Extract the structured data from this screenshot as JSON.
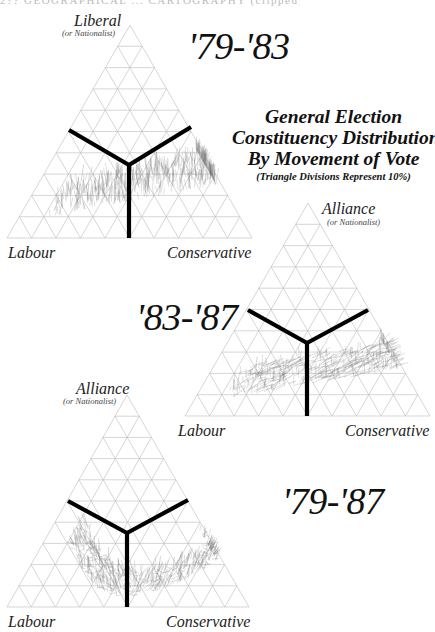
{
  "page": {
    "running_head": "2?? GEOGRAPHICAL ... CARTOGRAPHY (clipped)"
  },
  "title": {
    "lines": [
      "General Election",
      "Constituency Distribution",
      "By Movement of Vote"
    ],
    "subtitle": "(Triangle Divisions Represent 10%)"
  },
  "colors": {
    "grid": "#c4c4c4",
    "axis_y": "#000000",
    "scatter": "#8a8a8a",
    "scatter_dark": "#555555",
    "text": "#111111"
  },
  "chart_data": [
    {
      "type": "scatter",
      "subtype": "ternary-movement",
      "title": "'79-'83",
      "vertices": {
        "top": {
          "label": "Liberal",
          "sublabel": "(or Nationalist)"
        },
        "left": {
          "label": "Labour"
        },
        "right": {
          "label": "Conservative"
        }
      },
      "grid_divisions": 10,
      "grid_step_percent": 10,
      "divider": "Y-shaped boundaries meeting at centroid (33.3% each)",
      "scatter_description": "Constituency vote movement lines; band from lower-left (Labour side) sweeping up toward upper-right (Conservative/Liberal), roughly 10-40% Liberal share",
      "scatter_region": {
        "liberal_pct_range": [
          8,
          42
        ],
        "cons_pct_range": [
          15,
          75
        ],
        "orientation": "near-vertical strokes, upward to Liberal"
      }
    },
    {
      "type": "scatter",
      "subtype": "ternary-movement",
      "title": "'83-'87",
      "vertices": {
        "top": {
          "label": "Alliance",
          "sublabel": "(or Nationalist)"
        },
        "left": {
          "label": "Labour"
        },
        "right": {
          "label": "Conservative"
        }
      },
      "grid_divisions": 10,
      "grid_step_percent": 10,
      "divider": "Y-shaped boundaries meeting at centroid (33.3% each)",
      "scatter_description": "Movement lines mostly diagonal (Labour-ward shifts), concentrated 10-35% Alliance share",
      "scatter_region": {
        "liberal_pct_range": [
          8,
          38
        ],
        "cons_pct_range": [
          15,
          72
        ],
        "orientation": "diagonal strokes"
      }
    },
    {
      "type": "scatter",
      "subtype": "ternary-movement",
      "title": "'79-'87",
      "vertices": {
        "top": {
          "label": "Alliance",
          "sublabel": "(or Nationalist)"
        },
        "left": {
          "label": "Labour"
        },
        "right": {
          "label": "Conservative"
        }
      },
      "grid_divisions": 10,
      "grid_step_percent": 10,
      "divider": "Y-shaped boundaries meeting at centroid (33.3% each)",
      "scatter_description": "Movement lines forming a U / smile-shaped band, low at centre (~5-15% Alliance), rising at both Labour and Conservative ends to ~40%",
      "scatter_region": {
        "liberal_pct_range": [
          4,
          42
        ],
        "cons_pct_range": [
          10,
          78
        ],
        "orientation": "curved U-shaped band"
      }
    }
  ],
  "layout": {
    "triangles": [
      {
        "apex": [
          130,
          25
        ],
        "left": [
          7,
          238
        ],
        "right": [
          252,
          238
        ],
        "center": [
          129,
          165
        ],
        "arm_left": [
          69,
          130
        ],
        "arm_right": [
          191,
          127
        ],
        "seed": 11,
        "mode": "vertical",
        "count": 520,
        "period_pos": [
          188,
          27
        ],
        "top_label_pos": [
          74,
          13
        ],
        "top_sub_pos": [
          62,
          29
        ],
        "left_label_pos": [
          8,
          245
        ],
        "right_label_pos": [
          167,
          245
        ]
      },
      {
        "apex": [
          308,
          203
        ],
        "left": [
          185,
          416
        ],
        "right": [
          430,
          416
        ],
        "center": [
          307,
          343
        ],
        "arm_left": [
          248,
          310
        ],
        "arm_right": [
          368,
          310
        ],
        "seed": 37,
        "mode": "diagonal",
        "count": 420,
        "period_pos": [
          136,
          298
        ],
        "top_label_pos": [
          322,
          201
        ],
        "top_sub_pos": [
          327,
          218
        ],
        "left_label_pos": [
          178,
          423
        ],
        "right_label_pos": [
          345,
          423
        ]
      },
      {
        "apex": [
          127,
          395
        ],
        "left": [
          7,
          607
        ],
        "right": [
          249,
          607
        ],
        "center": [
          127,
          533
        ],
        "arm_left": [
          68,
          501
        ],
        "arm_right": [
          188,
          500
        ],
        "seed": 73,
        "mode": "smile",
        "count": 560,
        "period_pos": [
          282,
          482
        ],
        "top_label_pos": [
          76,
          381
        ],
        "top_sub_pos": [
          63,
          397
        ],
        "left_label_pos": [
          8,
          614
        ],
        "right_label_pos": [
          166,
          614
        ]
      }
    ]
  }
}
